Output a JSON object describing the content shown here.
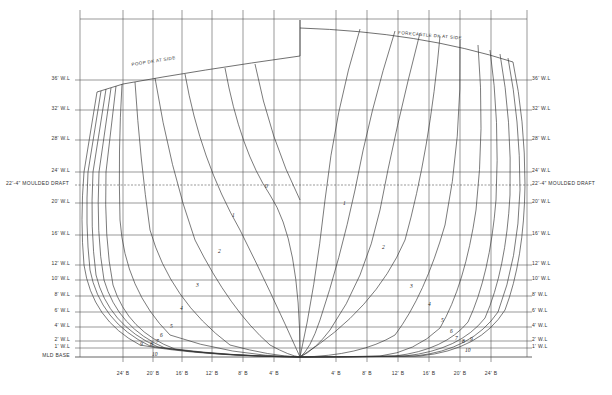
{
  "waterlines": [
    {
      "label": "36' W.L",
      "y": 80
    },
    {
      "label": "32' W.L",
      "y": 110
    },
    {
      "label": "28' W.L",
      "y": 140
    },
    {
      "label": "24' W.L",
      "y": 172
    },
    {
      "label": "20' W.L",
      "y": 203
    },
    {
      "label": "16' W.L",
      "y": 235
    },
    {
      "label": "12' W.L",
      "y": 265
    },
    {
      "label": "10' W.L",
      "y": 280
    },
    {
      "label": "8' W.L",
      "y": 296
    },
    {
      "label": "6' W.L",
      "y": 312
    },
    {
      "label": "4' W.L",
      "y": 327
    },
    {
      "label": "2' W.L",
      "y": 341
    },
    {
      "label": "1' W.L",
      "y": 348
    }
  ],
  "draft_line": {
    "label_left": "22'-4\" MOULDED DRAFT",
    "label_right": "22'-4\" MOULDED DRAFT",
    "y": 185
  },
  "base_line": {
    "label": "MLD BASE",
    "y": 357
  },
  "buttocks_left": [
    "24' B",
    "20' B",
    "16' B",
    "12' B",
    "8' B",
    "4' B"
  ],
  "buttocks_right": [
    "4' B",
    "8' B",
    "12' B",
    "16' B",
    "20' B",
    "24' B"
  ],
  "deck_labels": {
    "left": "POOP DK AT SIDE",
    "right": "FORECASTLE DK AT SIDE"
  },
  "section_numbers_left": [
    "0",
    "1",
    "2",
    "3",
    "4",
    "5",
    "6",
    "7",
    "8",
    "9",
    "10"
  ],
  "section_numbers_right": [
    "1",
    "2",
    "3",
    "4",
    "5",
    "6",
    "7",
    "8",
    "9",
    "10"
  ],
  "colors": {
    "line": "#3a3a3a",
    "grid": "#555555",
    "paper": "#ffffff"
  }
}
